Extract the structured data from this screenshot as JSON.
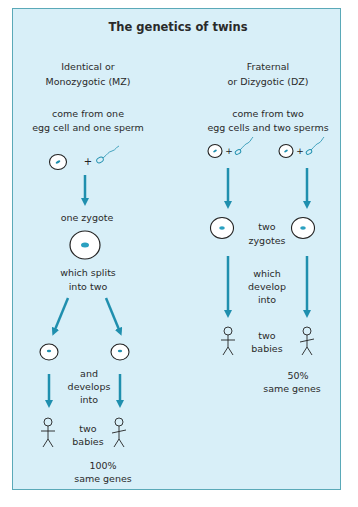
{
  "title": "The genetics of twins",
  "colors": {
    "panel_bg": "#d8eff8",
    "border": "#5aa9b8",
    "arrow": "#1f8fae",
    "text": "#2a2a2a"
  },
  "identical": {
    "heading": [
      "Identical or",
      "Monozygotic (MZ)"
    ],
    "origin": [
      "come from one",
      "egg cell and one sperm"
    ],
    "step1": "one zygote",
    "step2": [
      "which splits",
      "into two"
    ],
    "step3": [
      "and",
      "develops",
      "into"
    ],
    "result": [
      "two",
      "babies"
    ],
    "genes": [
      "100%",
      "same genes"
    ]
  },
  "fraternal": {
    "heading": [
      "Fraternal",
      "or Dizygotic (DZ)"
    ],
    "origin": [
      "come from two",
      "egg cells and two sperms"
    ],
    "step1": [
      "two",
      "zygotes"
    ],
    "step2": [
      "which",
      "develop",
      "into"
    ],
    "result": [
      "two",
      "babies"
    ],
    "genes": [
      "50%",
      "same genes"
    ]
  },
  "symbols": {
    "plus": "+",
    "egg": "egg-cell-icon",
    "sperm": "sperm-icon",
    "baby": "stick-figure-icon",
    "arrow": "down-arrow-icon"
  }
}
